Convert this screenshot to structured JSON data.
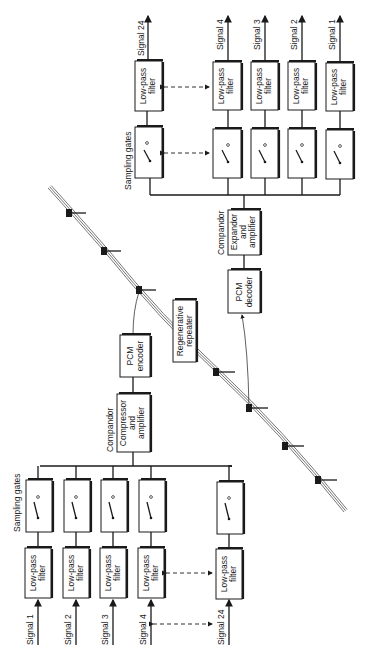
{
  "diagram": {
    "orientation": "rotated -90deg",
    "colors": {
      "ink": "#1a1a1a",
      "background": "#ffffff"
    },
    "transmit": {
      "inputs": [
        {
          "label": "Signal 1",
          "filter": [
            "Low-pass",
            "filter"
          ]
        },
        {
          "label": "Signal 2",
          "filter": [
            "Low-pass",
            "filter"
          ]
        },
        {
          "label": "Signal 3",
          "filter": [
            "Low-pass",
            "filter"
          ]
        },
        {
          "label": "Signal 4",
          "filter": [
            "Low-pass",
            "filter"
          ]
        },
        {
          "label": "Signal 24",
          "filter": [
            "Low-pass",
            "filter"
          ]
        }
      ],
      "gates_label": "Sampling gates",
      "compandor_label": "Compandor",
      "compressor": [
        "Compressor",
        "and",
        "amplifier"
      ],
      "encoder": [
        "PCM",
        "encoder"
      ]
    },
    "line": {
      "repeater": [
        "Regenerative",
        "repeater"
      ]
    },
    "receive": {
      "decoder": [
        "PCM",
        "decoder"
      ],
      "compandor_label": "Compandor",
      "expandor": [
        "Expandor",
        "and",
        "amplifier"
      ],
      "gates_label": "Sampling gates",
      "outputs": [
        {
          "label": "Signal 24",
          "filter": [
            "Low-pass",
            "filter"
          ]
        },
        {
          "label": "Signal 4",
          "filter": [
            "Low-pass",
            "filter"
          ]
        },
        {
          "label": "Signal 3",
          "filter": [
            "Low-pass",
            "filter"
          ]
        },
        {
          "label": "Signal 2",
          "filter": [
            "Low-pass",
            "filter"
          ]
        },
        {
          "label": "Signal 1",
          "filter": [
            "Low-pass",
            "filter"
          ]
        }
      ]
    }
  }
}
